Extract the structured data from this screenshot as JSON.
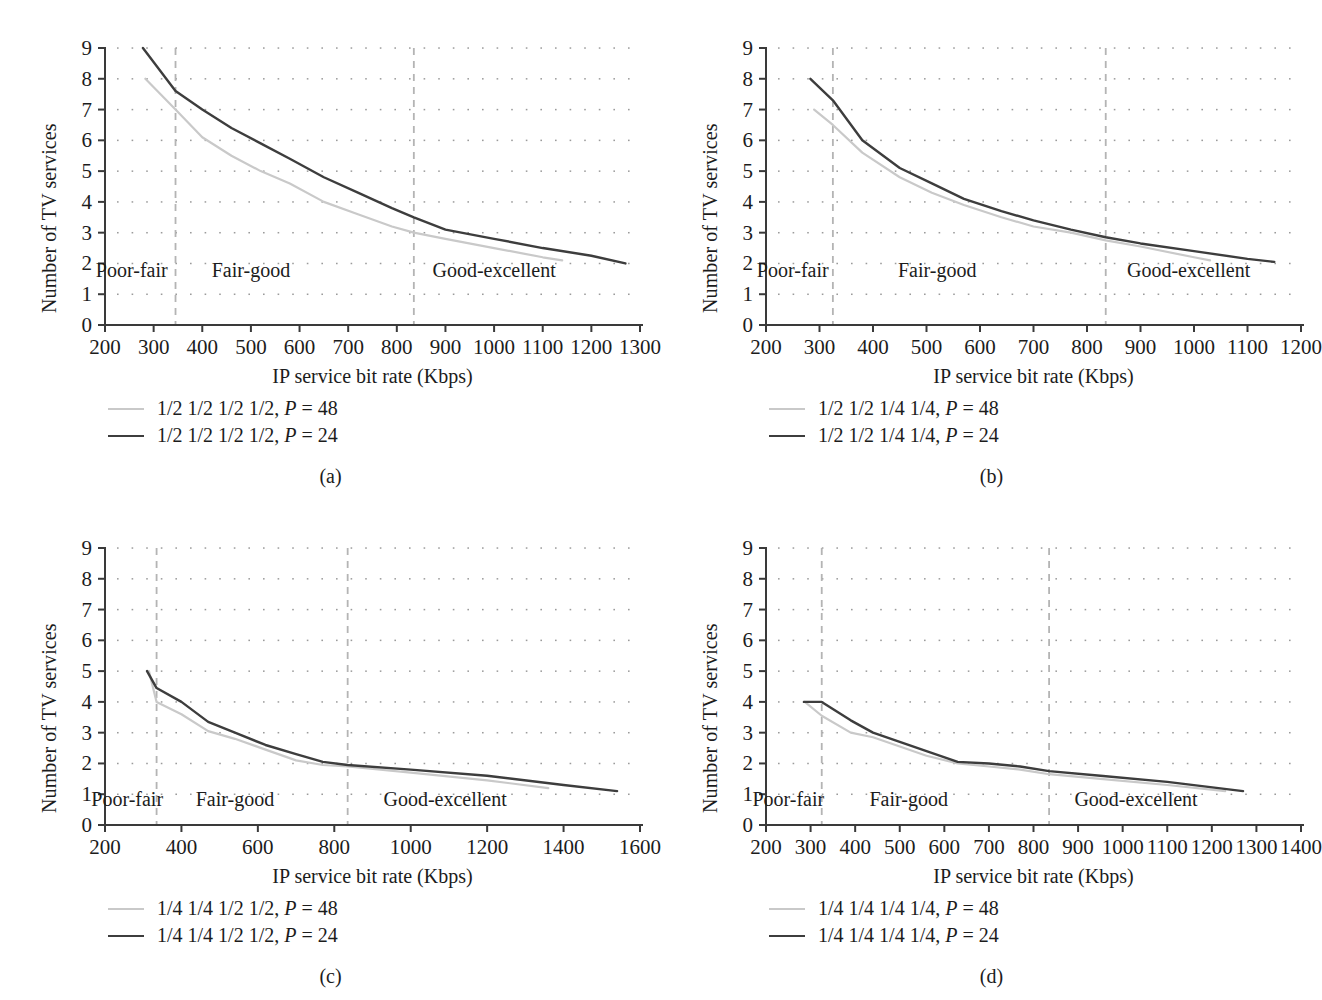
{
  "figure": {
    "common": {
      "ylabel": "Number of TV services",
      "xlabel": "IP service bit rate (Kbps)",
      "yticks": [
        "0",
        "1",
        "2",
        "3",
        "4",
        "5",
        "6",
        "7",
        "8",
        "9"
      ],
      "regions": [
        "Poor-fair",
        "Fair-good",
        "Good-excellent"
      ],
      "colors": {
        "series_light": "#c9c9c9",
        "series_dark": "#3d3d3d",
        "axis": "#3a3a3a",
        "grid": "#8a8a8a",
        "divider": "#b4b4b4",
        "text": "#1c1c1c"
      }
    },
    "panels": [
      {
        "id": "a",
        "caption": "(a)",
        "legend": [
          {
            "style": "light",
            "label": "1/2 1/2 1/2 1/2, P = 48"
          },
          {
            "style": "dark",
            "label": "1/2 1/2 1/2 1/2, P = 24"
          }
        ],
        "chart_data": {
          "type": "line",
          "title": "",
          "xlabel": "IP service bit rate (Kbps)",
          "ylabel": "Number of TV services",
          "xlim": [
            200,
            1300
          ],
          "ylim": [
            0,
            9
          ],
          "xticks": [
            200,
            300,
            400,
            500,
            600,
            700,
            800,
            900,
            1000,
            1100,
            1200,
            1300
          ],
          "yticks": [
            0,
            1,
            2,
            3,
            4,
            5,
            6,
            7,
            8,
            9
          ],
          "grid": "dotted",
          "legend_position": "below-plot",
          "region_dividers": [
            345,
            835
          ],
          "region_labels": [
            {
              "text": "Poor-fair",
              "x": 255,
              "y": 1.55
            },
            {
              "text": "Fair-good",
              "x": 500,
              "y": 1.55
            },
            {
              "text": "Good-excellent",
              "x": 1000,
              "y": 1.55
            }
          ],
          "series": [
            {
              "name": "1/2 1/2 1/2 1/2, P = 48",
              "style": "light",
              "x": [
                283,
                345,
                400,
                460,
                520,
                580,
                650,
                720,
                790,
                835,
                900,
                1000,
                1100,
                1140
              ],
              "y": [
                8.0,
                7.0,
                6.1,
                5.5,
                5.0,
                4.6,
                4.0,
                3.6,
                3.2,
                3.0,
                2.8,
                2.5,
                2.2,
                2.1
              ]
            },
            {
              "name": "1/2 1/2 1/2 1/2, P = 24",
              "style": "dark",
              "x": [
                278,
                345,
                400,
                460,
                520,
                580,
                650,
                720,
                790,
                835,
                900,
                1000,
                1100,
                1200,
                1270
              ],
              "y": [
                9.0,
                7.6,
                7.0,
                6.4,
                5.9,
                5.4,
                4.8,
                4.3,
                3.8,
                3.5,
                3.1,
                2.8,
                2.5,
                2.25,
                2.0
              ]
            }
          ]
        }
      },
      {
        "id": "b",
        "caption": "(b)",
        "legend": [
          {
            "style": "light",
            "label": "1/2 1/2 1/4 1/4, P = 48"
          },
          {
            "style": "dark",
            "label": "1/2 1/2 1/4 1/4, P = 24"
          }
        ],
        "chart_data": {
          "type": "line",
          "title": "",
          "xlabel": "IP service bit rate (Kbps)",
          "ylabel": "Number of TV services",
          "xlim": [
            200,
            1200
          ],
          "ylim": [
            0,
            9
          ],
          "xticks": [
            200,
            300,
            400,
            500,
            600,
            700,
            800,
            900,
            1000,
            1100,
            1200
          ],
          "yticks": [
            0,
            1,
            2,
            3,
            4,
            5,
            6,
            7,
            8,
            9
          ],
          "grid": "dotted",
          "legend_position": "below-plot",
          "region_dividers": [
            325,
            835
          ],
          "region_labels": [
            {
              "text": "Poor-fair",
              "x": 250,
              "y": 1.55
            },
            {
              "text": "Fair-good",
              "x": 520,
              "y": 1.55
            },
            {
              "text": "Good-excellent",
              "x": 990,
              "y": 1.55
            }
          ],
          "series": [
            {
              "name": "1/2 1/2 1/4 1/4, P = 48",
              "style": "light",
              "x": [
                290,
                325,
                380,
                450,
                510,
                570,
                640,
                700,
                770,
                835,
                900,
                1000,
                1030
              ],
              "y": [
                7.0,
                6.5,
                5.6,
                4.8,
                4.3,
                3.9,
                3.5,
                3.2,
                3.0,
                2.75,
                2.55,
                2.2,
                2.1
              ]
            },
            {
              "name": "1/2 1/2 1/4 1/4, P = 24",
              "style": "dark",
              "x": [
                283,
                325,
                380,
                450,
                510,
                570,
                640,
                700,
                770,
                835,
                900,
                1000,
                1100,
                1150
              ],
              "y": [
                8.0,
                7.3,
                6.0,
                5.1,
                4.6,
                4.1,
                3.7,
                3.4,
                3.1,
                2.85,
                2.65,
                2.4,
                2.15,
                2.05
              ]
            }
          ]
        }
      },
      {
        "id": "c",
        "caption": "(c)",
        "legend": [
          {
            "style": "light",
            "label": "1/4 1/4 1/2 1/2, P = 48"
          },
          {
            "style": "dark",
            "label": "1/4 1/4 1/2 1/2, P = 24"
          }
        ],
        "chart_data": {
          "type": "line",
          "title": "",
          "xlabel": "IP service bit rate (Kbps)",
          "ylabel": "Number of TV services",
          "xlim": [
            200,
            1600
          ],
          "ylim": [
            0,
            9
          ],
          "xticks": [
            200,
            400,
            600,
            800,
            1000,
            1200,
            1400,
            1600
          ],
          "yticks": [
            0,
            1,
            2,
            3,
            4,
            5,
            6,
            7,
            8,
            9
          ],
          "grid": "dotted",
          "legend_position": "below-plot",
          "region_dividers": [
            335,
            835
          ],
          "region_labels": [
            {
              "text": "Poor-fair",
              "x": 258,
              "y": 0.62
            },
            {
              "text": "Fair-good",
              "x": 540,
              "y": 0.62
            },
            {
              "text": "Good-excellent",
              "x": 1090,
              "y": 0.62
            }
          ],
          "series": [
            {
              "name": "1/4 1/4 1/2 1/2, P = 48",
              "style": "light",
              "x": [
                315,
                335,
                400,
                470,
                540,
                620,
                700,
                770,
                835,
                1000,
                1200,
                1360
              ],
              "y": [
                5.0,
                4.0,
                3.6,
                3.05,
                2.8,
                2.45,
                2.1,
                1.95,
                1.9,
                1.7,
                1.45,
                1.2
              ]
            },
            {
              "name": "1/4 1/4 1/2 1/2, P = 24",
              "style": "dark",
              "x": [
                310,
                335,
                400,
                470,
                540,
                620,
                700,
                770,
                835,
                1000,
                1200,
                1400,
                1540
              ],
              "y": [
                5.0,
                4.45,
                4.0,
                3.35,
                3.0,
                2.6,
                2.3,
                2.05,
                1.95,
                1.8,
                1.6,
                1.3,
                1.1
              ]
            }
          ]
        }
      },
      {
        "id": "d",
        "caption": "(d)",
        "legend": [
          {
            "style": "light",
            "label": "1/4 1/4 1/4 1/4, P = 48"
          },
          {
            "style": "dark",
            "label": "1/4 1/4 1/4 1/4, P = 24"
          }
        ],
        "chart_data": {
          "type": "line",
          "title": "",
          "xlabel": "IP service bit rate (Kbps)",
          "ylabel": "Number of TV services",
          "xlim": [
            200,
            1400
          ],
          "ylim": [
            0,
            9
          ],
          "xticks": [
            200,
            300,
            400,
            500,
            600,
            700,
            800,
            900,
            1000,
            1100,
            1200,
            1300,
            1400
          ],
          "yticks": [
            0,
            1,
            2,
            3,
            4,
            5,
            6,
            7,
            8,
            9
          ],
          "grid": "dotted",
          "legend_position": "below-plot",
          "region_dividers": [
            325,
            835
          ],
          "region_labels": [
            {
              "text": "Poor-fair",
              "x": 250,
              "y": 0.62
            },
            {
              "text": "Fair-good",
              "x": 520,
              "y": 0.62
            },
            {
              "text": "Good-excellent",
              "x": 1030,
              "y": 0.62
            }
          ],
          "series": [
            {
              "name": "1/4 1/4 1/4 1/4, P = 48",
              "style": "light",
              "x": [
                287,
                325,
                390,
                440,
                500,
                560,
                630,
                700,
                770,
                835,
                950,
                1100,
                1230
              ],
              "y": [
                4.0,
                3.55,
                3.0,
                2.85,
                2.55,
                2.25,
                2.0,
                1.9,
                1.8,
                1.65,
                1.5,
                1.3,
                1.1
              ]
            },
            {
              "name": "1/4 1/4 1/4 1/4, P = 24",
              "style": "dark",
              "x": [
                285,
                325,
                390,
                440,
                500,
                560,
                630,
                700,
                770,
                835,
                950,
                1100,
                1270
              ],
              "y": [
                4.0,
                4.0,
                3.4,
                3.0,
                2.7,
                2.4,
                2.05,
                2.0,
                1.9,
                1.75,
                1.6,
                1.4,
                1.1
              ]
            }
          ]
        }
      }
    ]
  }
}
